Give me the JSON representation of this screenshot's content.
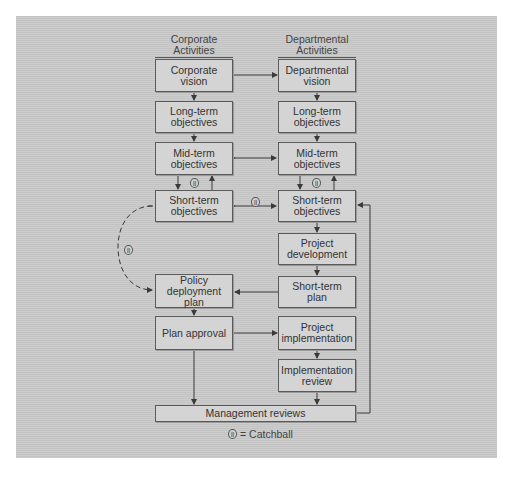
{
  "headers": {
    "corporate": "Corporate Activities",
    "departmental": "Departmental Activities"
  },
  "corporate_boxes": {
    "vision": "Corporate vision",
    "long_term": "Long-term objectives",
    "mid_term": "Mid-term objectives",
    "short_term": "Short-term objectives",
    "policy": "Policy deployment plan",
    "approval": "Plan approval"
  },
  "departmental_boxes": {
    "vision": "Departmental vision",
    "long_term": "Long-term objectives",
    "mid_term": "Mid-term objectives",
    "short_term": "Short-term objectives",
    "project_dev": "Project development",
    "short_plan": "Short-term plan",
    "project_impl": "Project implementation",
    "impl_review": "Implementation review"
  },
  "management": "Management reviews",
  "legend": {
    "symbol": "ll",
    "text": "= Catchball"
  },
  "catchball_symbol": "ll",
  "colors": {
    "line": "#3a3a3a",
    "box_fill": "#d4d4d4",
    "panel": "#c9c9c9"
  }
}
